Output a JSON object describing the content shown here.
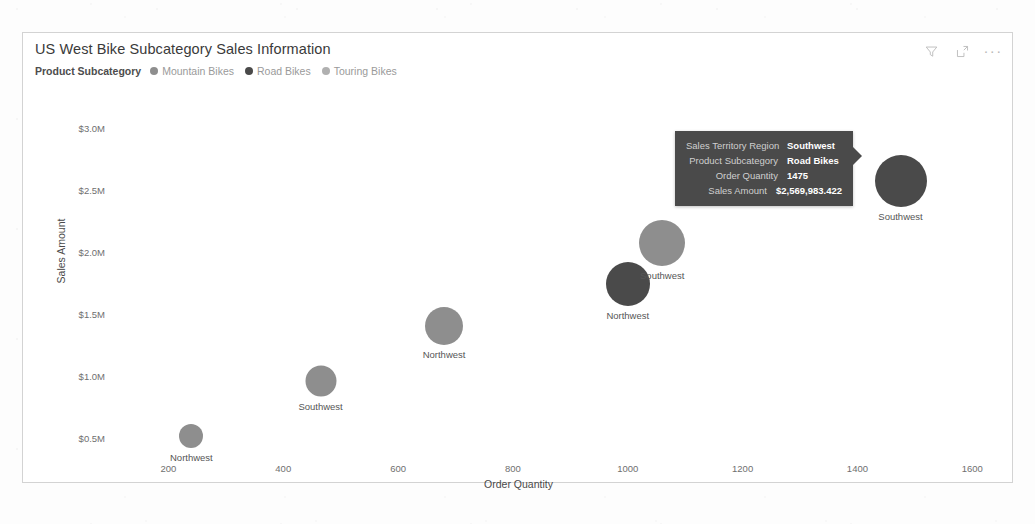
{
  "visual": {
    "title": "US West Bike Subcategory Sales Information",
    "actions": {
      "filter": "filter-icon",
      "focus": "focus-mode-icon",
      "more": "···"
    }
  },
  "legend": {
    "title": "Product Subcategory",
    "items": [
      {
        "label": "Mountain Bikes",
        "color": "#8e8e8e"
      },
      {
        "label": "Road Bikes",
        "color": "#4a4a4a"
      },
      {
        "label": "Touring Bikes",
        "color": "#b0b0b0"
      }
    ]
  },
  "tooltip": {
    "rows": [
      {
        "key": "Sales Territory Region",
        "value": "Southwest"
      },
      {
        "key": "Product Subcategory",
        "value": "Road Bikes"
      },
      {
        "key": "Order Quantity",
        "value": "1475"
      },
      {
        "key": "Sales Amount",
        "value": "$2,569,983.422"
      }
    ]
  },
  "chart_data": {
    "type": "scatter",
    "title": "US West Bike Subcategory Sales Information",
    "xlabel": "Order Quantity",
    "ylabel": "Sales Amount",
    "xlim": [
      100,
      1650
    ],
    "ylim": [
      300000,
      3200000
    ],
    "grid": false,
    "legend_position": "top-left",
    "xticks": [
      "200",
      "400",
      "600",
      "800",
      "1000",
      "1200",
      "1400",
      "1600"
    ],
    "xtick_values": [
      200,
      400,
      600,
      800,
      1000,
      1200,
      1400,
      1600
    ],
    "yticks": [
      "$0.5M",
      "$1.0M",
      "$1.5M",
      "$2.0M",
      "$2.5M",
      "$3.0M"
    ],
    "ytick_values": [
      500000,
      1000000,
      1500000,
      2000000,
      2500000,
      3000000
    ],
    "points": [
      {
        "label": "Northwest",
        "subcategory": "Touring Bikes",
        "x": 240,
        "y": 520000,
        "size": 24,
        "color": "#8e8e8e"
      },
      {
        "label": "Southwest",
        "subcategory": "Touring Bikes",
        "x": 465,
        "y": 960000,
        "size": 31,
        "color": "#8e8e8e"
      },
      {
        "label": "Northwest",
        "subcategory": "Mountain Bikes",
        "x": 680,
        "y": 1400000,
        "size": 38,
        "color": "#8e8e8e"
      },
      {
        "label": "Northwest",
        "subcategory": "Road Bikes",
        "x": 1000,
        "y": 1740000,
        "size": 44,
        "color": "#4a4a4a"
      },
      {
        "label": "Southwest",
        "subcategory": "Mountain Bikes",
        "x": 1060,
        "y": 2075000,
        "size": 46,
        "color": "#8e8e8e"
      },
      {
        "label": "Southwest",
        "subcategory": "Road Bikes",
        "x": 1475,
        "y": 2569983,
        "size": 52,
        "color": "#4a4a4a"
      }
    ]
  }
}
